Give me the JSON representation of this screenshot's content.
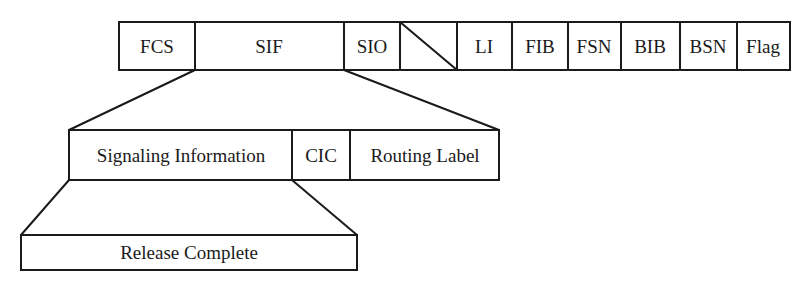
{
  "diagram": {
    "type": "packet-structure",
    "stroke_color": "#1a1a1a",
    "background": "#ffffff",
    "top_row": {
      "name": "MSU frame",
      "fields": [
        {
          "id": "fcs",
          "label": "FCS",
          "x0": 119,
          "x1": 195
        },
        {
          "id": "sif",
          "label": "SIF",
          "x0": 195,
          "x1": 344
        },
        {
          "id": "sio",
          "label": "SIO",
          "x0": 344,
          "x1": 400
        },
        {
          "id": "spare",
          "label": "",
          "x0": 400,
          "x1": 457,
          "diagonal": true
        },
        {
          "id": "li",
          "label": "LI",
          "x0": 457,
          "x1": 512
        },
        {
          "id": "fib",
          "label": "FIB",
          "x0": 512,
          "x1": 568
        },
        {
          "id": "fsn",
          "label": "FSN",
          "x0": 568,
          "x1": 621
        },
        {
          "id": "bib",
          "label": "BIB",
          "x0": 621,
          "x1": 680
        },
        {
          "id": "bsn",
          "label": "BSN",
          "x0": 680,
          "x1": 737
        },
        {
          "id": "flag",
          "label": "Flag",
          "x0": 737,
          "x1": 790
        }
      ]
    },
    "middle_row": {
      "name": "SIF expansion",
      "fields": [
        {
          "id": "signaling-information",
          "label": "Signaling Information",
          "x0": 69,
          "x1": 292
        },
        {
          "id": "cic",
          "label": "CIC",
          "x0": 292,
          "x1": 350
        },
        {
          "id": "routing-label",
          "label": "Routing Label",
          "x0": 350,
          "x1": 499
        }
      ]
    },
    "bottom_row": {
      "name": "Signaling Information expansion",
      "fields": [
        {
          "id": "release-complete",
          "label": "Release Complete",
          "x0": 21,
          "x1": 357
        }
      ]
    }
  }
}
